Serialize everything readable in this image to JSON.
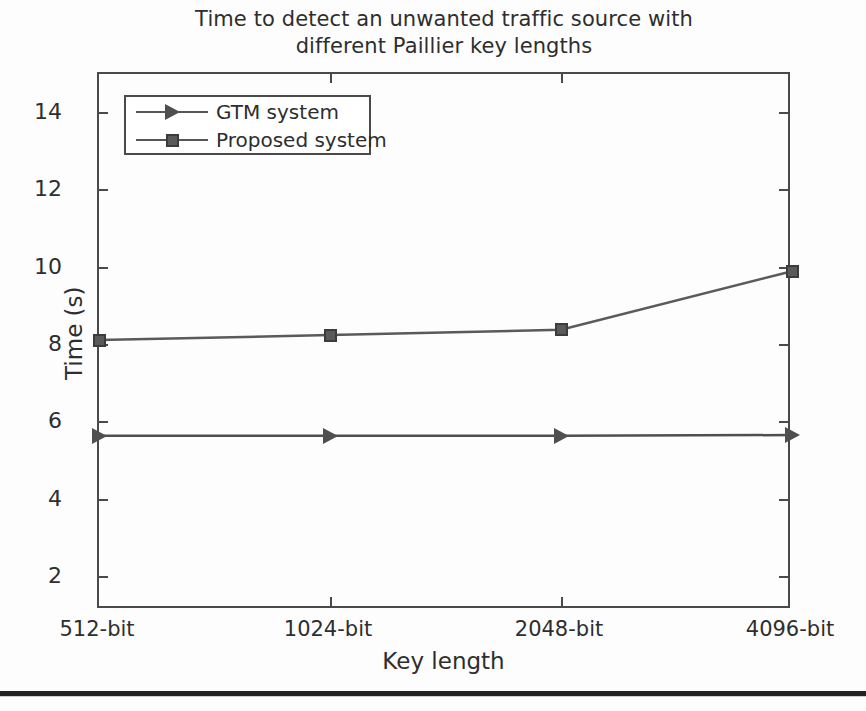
{
  "chart_data": {
    "type": "line",
    "title": "Time to detect an unwanted traffic source with different Paillier key lengths",
    "title_line1": "Time to detect an unwanted traffic source with",
    "title_line2": "different Paillier key lengths",
    "xlabel": "Key length",
    "ylabel": "Time (s)",
    "categories": [
      "512-bit",
      "1024-bit",
      "2048-bit",
      "4096-bit"
    ],
    "ylim": [
      1,
      15
    ],
    "yticks": [
      2,
      4,
      6,
      8,
      10,
      12,
      14
    ],
    "ytick_labels": [
      "2",
      "4",
      "6",
      "8",
      "10",
      "12",
      "14"
    ],
    "grid": false,
    "legend_position": "upper left",
    "series": [
      {
        "name": "GTM system",
        "marker": "triangle-right",
        "color": "#4f4f4f",
        "values": [
          5.55,
          5.55,
          5.55,
          5.57
        ]
      },
      {
        "name": "Proposed system",
        "marker": "square",
        "color": "#5a5a5a",
        "values": [
          8.05,
          8.18,
          8.32,
          9.85
        ]
      }
    ]
  },
  "legend": {
    "items": [
      {
        "label": "GTM system",
        "marker": "triangle-right-icon"
      },
      {
        "label": "Proposed system",
        "marker": "square-icon"
      }
    ]
  },
  "colors": {
    "axis": "#4a4a4a",
    "text": "#2e2e2e",
    "series_gtm": "#4f4f4f",
    "series_proposed": "#5a5a5a",
    "background": "#fdfdfd",
    "page_rule": "#232323"
  }
}
